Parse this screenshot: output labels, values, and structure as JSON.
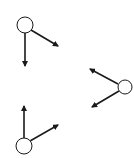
{
  "diagram": {
    "background": "#ffffff",
    "stroke_color": "#1a1a1a",
    "nodes": [
      {
        "id": "node-top-left",
        "cx": 25,
        "cy": 25,
        "r": 8,
        "arrows": [
          {
            "x1": 25,
            "y1": 33,
            "x2": 25,
            "y2": 66
          },
          {
            "x1": 31,
            "y1": 30,
            "x2": 58,
            "y2": 46
          }
        ]
      },
      {
        "id": "node-right",
        "cx": 125,
        "cy": 87,
        "r": 7,
        "arrows": [
          {
            "x1": 118,
            "y1": 84,
            "x2": 90,
            "y2": 69
          },
          {
            "x1": 119,
            "y1": 91,
            "x2": 92,
            "y2": 107
          }
        ]
      },
      {
        "id": "node-bottom-left",
        "cx": 24,
        "cy": 146,
        "r": 8,
        "arrows": [
          {
            "x1": 24,
            "y1": 138,
            "x2": 24,
            "y2": 106
          },
          {
            "x1": 30,
            "y1": 141,
            "x2": 58,
            "y2": 125
          }
        ]
      }
    ]
  }
}
